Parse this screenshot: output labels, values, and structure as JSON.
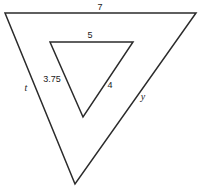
{
  "figure": {
    "background_color": "#ffffff",
    "stroke_color": "#2b2b2b",
    "text_color": "#1a1a1a",
    "outer_triangle": {
      "name": "outer-triangle",
      "points": "5,13 196,13 75,184"
    },
    "inner_triangle": {
      "name": "inner-triangle",
      "points": "50,42 133,42 83,117"
    },
    "labels": {
      "outer_top": {
        "text": "7",
        "x": 100,
        "y": 7,
        "style": "num"
      },
      "outer_left": {
        "text": "t",
        "x": 26,
        "y": 88,
        "style": "var"
      },
      "outer_right": {
        "text": "y",
        "x": 143,
        "y": 97,
        "style": "var"
      },
      "inner_top": {
        "text": "5",
        "x": 90,
        "y": 35,
        "style": "num"
      },
      "inner_left": {
        "text": "3.75",
        "x": 52,
        "y": 79,
        "style": "num"
      },
      "inner_right": {
        "text": "4",
        "x": 110,
        "y": 85,
        "style": "num"
      }
    }
  }
}
